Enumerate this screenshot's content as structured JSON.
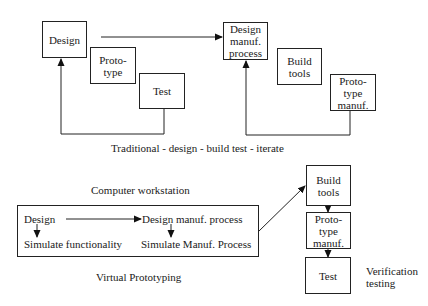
{
  "traditional": {
    "caption": "Traditional - design - build test - iterate",
    "loop1": {
      "design": "Design",
      "prototype": "Proto-\ntype",
      "test": "Test"
    },
    "loop2": {
      "design_manuf": "Design\nmanuf.\nprocess",
      "build_tools": "Build\ntools",
      "prototype_manuf": "Proto-\ntype\nmanuf."
    }
  },
  "virtual": {
    "workstation_title": "Computer workstation",
    "caption": "Virtual Prototyping",
    "workstation": {
      "design": "Design",
      "design_manuf": "Design manuf. process",
      "simulate_functionality": "Simulate functionality",
      "simulate_manuf": "Simulate Manuf. Process"
    },
    "physical": {
      "build_tools": "Build\ntools",
      "prototype_manuf": "Proto-\ntype\nmanuf.",
      "test": "Test"
    },
    "verification_label": "Verification\ntesting"
  }
}
